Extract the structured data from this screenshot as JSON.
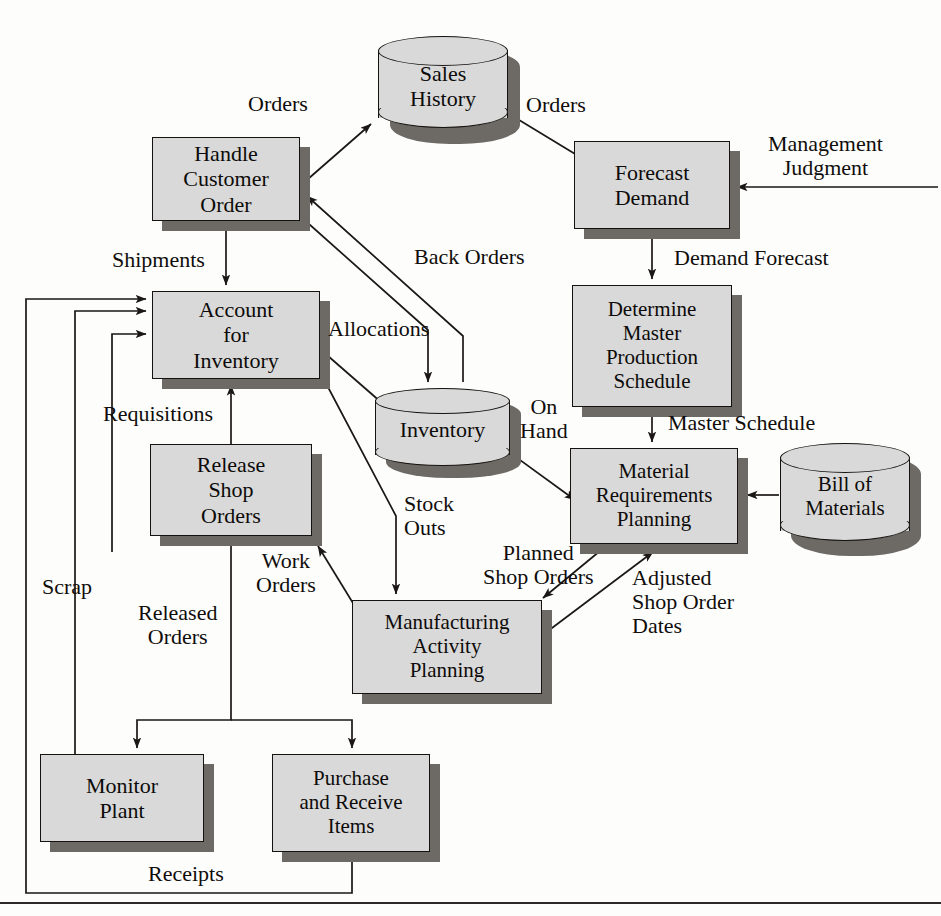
{
  "diagram": {
    "colors": {
      "box_fill": "#d9d9d9",
      "box_border": "#15120f",
      "shadow": "#6d6a66",
      "text": "#0d0b09",
      "background": "#fdfdfc",
      "line": "#1a1714"
    },
    "nodes": [
      {
        "id": "handle_customer_order",
        "label": "Handle\nCustomer\nOrder",
        "shape": "process",
        "x": 152,
        "y": 137,
        "w": 148,
        "h": 84
      },
      {
        "id": "account_for_inventory",
        "label": "Account\nfor\nInventory",
        "shape": "process",
        "x": 152,
        "y": 291,
        "w": 168,
        "h": 88
      },
      {
        "id": "release_shop_orders",
        "label": "Release\nShop\nOrders",
        "shape": "process",
        "x": 150,
        "y": 444,
        "w": 162,
        "h": 92
      },
      {
        "id": "monitor_plant",
        "label": "Monitor\nPlant",
        "shape": "process",
        "x": 40,
        "y": 754,
        "w": 164,
        "h": 88
      },
      {
        "id": "purchase_receive",
        "label": "Purchase\nand Receive\nItems",
        "shape": "process",
        "x": 272,
        "y": 754,
        "w": 158,
        "h": 98
      },
      {
        "id": "manufacturing_activity",
        "label": "Manufacturing\nActivity\nPlanning",
        "shape": "process",
        "x": 352,
        "y": 600,
        "w": 190,
        "h": 94
      },
      {
        "id": "forecast_demand",
        "label": "Forecast\nDemand",
        "shape": "process",
        "x": 574,
        "y": 141,
        "w": 156,
        "h": 88
      },
      {
        "id": "determine_mps",
        "label": "Determine\nMaster\nProduction\nSchedule",
        "shape": "process",
        "x": 572,
        "y": 285,
        "w": 160,
        "h": 122
      },
      {
        "id": "material_requirements",
        "label": "Material\nRequirements\nPlanning",
        "shape": "process",
        "x": 570,
        "y": 448,
        "w": 168,
        "h": 96
      },
      {
        "id": "sales_history",
        "label": "Sales\nHistory",
        "shape": "cylinder",
        "x": 378,
        "y": 36,
        "w": 130,
        "h": 96
      },
      {
        "id": "inventory",
        "label": "Inventory",
        "shape": "cylinder",
        "x": 375,
        "y": 388,
        "w": 135,
        "h": 80
      },
      {
        "id": "bill_of_materials",
        "label": "Bill of\nMaterials",
        "shape": "cylinder",
        "x": 780,
        "y": 443,
        "w": 130,
        "h": 102
      }
    ],
    "flow_labels": [
      {
        "id": "orders_to_history",
        "text": "Orders",
        "x": 248,
        "y": 92,
        "align": "left"
      },
      {
        "id": "orders_to_forecast",
        "text": "Orders",
        "x": 526,
        "y": 93,
        "align": "left"
      },
      {
        "id": "management_judgment",
        "text": "Management\nJudgment",
        "x": 768,
        "y": 132,
        "align": "center"
      },
      {
        "id": "shipments",
        "text": "Shipments",
        "x": 112,
        "y": 248,
        "align": "left"
      },
      {
        "id": "back_orders",
        "text": "Back Orders",
        "x": 414,
        "y": 245,
        "align": "left"
      },
      {
        "id": "demand_forecast",
        "text": "Demand Forecast",
        "x": 674,
        "y": 246,
        "align": "left"
      },
      {
        "id": "allocations",
        "text": "Allocations",
        "x": 328,
        "y": 317,
        "align": "left"
      },
      {
        "id": "requisitions",
        "text": "Requisitions",
        "x": 103,
        "y": 402,
        "align": "left"
      },
      {
        "id": "on_hand",
        "text": "On\nHand",
        "x": 520,
        "y": 395,
        "align": "left"
      },
      {
        "id": "master_schedule",
        "text": "Master Schedule",
        "x": 668,
        "y": 411,
        "align": "left"
      },
      {
        "id": "stock_outs",
        "text": "Stock\nOuts",
        "x": 404,
        "y": 492,
        "align": "left"
      },
      {
        "id": "work_orders",
        "text": "Work\nOrders",
        "x": 256,
        "y": 549,
        "align": "left"
      },
      {
        "id": "planned_shop_orders",
        "text": "Planned\nShop Orders",
        "x": 483,
        "y": 541,
        "align": "left"
      },
      {
        "id": "adjusted_shop_dates",
        "text": "Adjusted\nShop Order\nDates",
        "x": 632,
        "y": 566,
        "align": "left"
      },
      {
        "id": "scrap",
        "text": "Scrap",
        "x": 42,
        "y": 575,
        "align": "left"
      },
      {
        "id": "released_orders",
        "text": "Released\nOrders",
        "x": 138,
        "y": 601,
        "align": "left"
      },
      {
        "id": "receipts",
        "text": "Receipts",
        "x": 148,
        "y": 862,
        "align": "left"
      }
    ],
    "edges": [
      {
        "id": "e-orders-history",
        "from": "handle_customer_order",
        "to": "sales_history",
        "label": "Orders"
      },
      {
        "id": "e-orders-forecast",
        "from": "sales_history",
        "to": "forecast_demand",
        "label": "Orders"
      },
      {
        "id": "e-mgmt-judgment",
        "from": "external",
        "to": "forecast_demand",
        "label": "Management Judgment"
      },
      {
        "id": "e-shipments",
        "from": "handle_customer_order",
        "to": "account_for_inventory",
        "label": "Shipments"
      },
      {
        "id": "e-allocations",
        "from": "handle_customer_order",
        "to": "inventory",
        "label": "Allocations"
      },
      {
        "id": "e-back-orders",
        "from": "inventory",
        "to": "handle_customer_order",
        "label": "Back Orders"
      },
      {
        "id": "e-demand-forecast",
        "from": "forecast_demand",
        "to": "determine_mps",
        "label": "Demand Forecast"
      },
      {
        "id": "e-master-schedule",
        "from": "determine_mps",
        "to": "material_requirements",
        "label": "Master Schedule"
      },
      {
        "id": "e-on-hand",
        "from": "inventory",
        "to": "material_requirements",
        "label": "On Hand"
      },
      {
        "id": "e-bom",
        "from": "bill_of_materials",
        "to": "material_requirements",
        "label": ""
      },
      {
        "id": "e-allocations-inv",
        "from": "account_for_inventory",
        "to": "inventory",
        "label": ""
      },
      {
        "id": "e-stock-outs",
        "from": "account_for_inventory",
        "to": "manufacturing_activity",
        "label": "Stock Outs"
      },
      {
        "id": "e-planned-shop-orders",
        "from": "material_requirements",
        "to": "manufacturing_activity",
        "label": "Planned Shop Orders"
      },
      {
        "id": "e-adjusted-dates",
        "from": "manufacturing_activity",
        "to": "material_requirements",
        "label": "Adjusted Shop Order Dates"
      },
      {
        "id": "e-work-orders",
        "from": "manufacturing_activity",
        "to": "release_shop_orders",
        "label": "Work Orders"
      },
      {
        "id": "e-requisitions",
        "from": "release_shop_orders",
        "to": "account_for_inventory",
        "label": "Requisitions"
      },
      {
        "id": "e-released-orders",
        "from": "release_shop_orders",
        "to": "monitor_plant",
        "label": "Released Orders"
      },
      {
        "id": "e-released-purchase",
        "from": "release_shop_orders",
        "to": "purchase_receive",
        "label": "Released Orders"
      },
      {
        "id": "e-scrap",
        "from": "monitor_plant",
        "to": "account_for_inventory",
        "label": "Scrap"
      },
      {
        "id": "e-receipts",
        "from": "purchase_receive",
        "to": "account_for_inventory",
        "label": "Receipts"
      }
    ]
  }
}
